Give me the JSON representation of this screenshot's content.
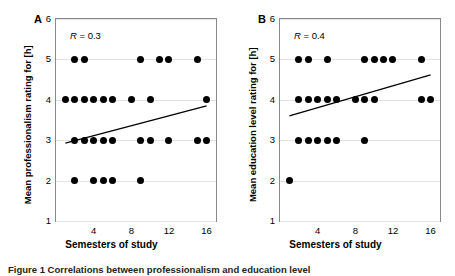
{
  "figure": {
    "caption": "Figure 1 Correlations between professionalism and education level"
  },
  "panels": [
    {
      "letter": "A",
      "ylabel": "Mean professionalism rating for [h]",
      "xlabel": "Semesters of study",
      "r_symbol": "R",
      "r_text": " = 0.3",
      "yticks": [
        "6",
        "5",
        "4",
        "3",
        "2",
        "1"
      ],
      "xticks": [
        "4",
        "8",
        "12",
        "16"
      ]
    },
    {
      "letter": "B",
      "ylabel": "Mean education level rating for [h]",
      "xlabel": "Semesters of study",
      "r_symbol": "R",
      "r_text": " = 0.4",
      "yticks": [
        "6",
        "5",
        "4",
        "3",
        "2",
        "1"
      ],
      "xticks": [
        "4",
        "8",
        "12",
        "16"
      ]
    }
  ],
  "chart_data": [
    {
      "type": "scatter",
      "panel": "A",
      "title": "",
      "xlabel": "Semesters of study",
      "ylabel": "Mean professionalism rating for [h]",
      "xlim": [
        0,
        17
      ],
      "ylim": [
        1,
        6
      ],
      "xticks": [
        4,
        8,
        12,
        16
      ],
      "yticks": [
        1,
        2,
        3,
        4,
        5,
        6
      ],
      "grid": true,
      "legend": null,
      "annotations": [
        {
          "text": "R = 0.3",
          "x": 2,
          "y": 5.6
        }
      ],
      "correlation_R": 0.3,
      "points": [
        {
          "x": 1,
          "y": 4
        },
        {
          "x": 2,
          "y": 5
        },
        {
          "x": 3,
          "y": 5
        },
        {
          "x": 9,
          "y": 5
        },
        {
          "x": 11,
          "y": 5
        },
        {
          "x": 12,
          "y": 5
        },
        {
          "x": 15,
          "y": 5
        },
        {
          "x": 2,
          "y": 4
        },
        {
          "x": 3,
          "y": 4
        },
        {
          "x": 4,
          "y": 4
        },
        {
          "x": 5,
          "y": 4
        },
        {
          "x": 6,
          "y": 4
        },
        {
          "x": 8,
          "y": 4
        },
        {
          "x": 10,
          "y": 4
        },
        {
          "x": 16,
          "y": 4
        },
        {
          "x": 2,
          "y": 3
        },
        {
          "x": 3,
          "y": 3
        },
        {
          "x": 4,
          "y": 3
        },
        {
          "x": 5,
          "y": 3
        },
        {
          "x": 6,
          "y": 3
        },
        {
          "x": 9,
          "y": 3
        },
        {
          "x": 10,
          "y": 3
        },
        {
          "x": 12,
          "y": 3
        },
        {
          "x": 15,
          "y": 3
        },
        {
          "x": 16,
          "y": 3
        },
        {
          "x": 2,
          "y": 2
        },
        {
          "x": 4,
          "y": 2
        },
        {
          "x": 5,
          "y": 2
        },
        {
          "x": 6,
          "y": 2
        },
        {
          "x": 9,
          "y": 2
        }
      ],
      "fit_line": {
        "x1": 1,
        "y1": 2.93,
        "x2": 16,
        "y2": 3.85
      }
    },
    {
      "type": "scatter",
      "panel": "B",
      "title": "",
      "xlabel": "Semesters of study",
      "ylabel": "Mean education level rating for [h]",
      "xlim": [
        0,
        17
      ],
      "ylim": [
        1,
        6
      ],
      "xticks": [
        4,
        8,
        12,
        16
      ],
      "yticks": [
        1,
        2,
        3,
        4,
        5,
        6
      ],
      "grid": true,
      "legend": null,
      "annotations": [
        {
          "text": "R = 0.4",
          "x": 2,
          "y": 5.6
        }
      ],
      "correlation_R": 0.4,
      "points": [
        {
          "x": 2,
          "y": 5
        },
        {
          "x": 3,
          "y": 5
        },
        {
          "x": 5,
          "y": 5
        },
        {
          "x": 9,
          "y": 5
        },
        {
          "x": 10,
          "y": 5
        },
        {
          "x": 11,
          "y": 5
        },
        {
          "x": 12,
          "y": 5
        },
        {
          "x": 15,
          "y": 5
        },
        {
          "x": 2,
          "y": 4
        },
        {
          "x": 3,
          "y": 4
        },
        {
          "x": 4,
          "y": 4
        },
        {
          "x": 5,
          "y": 4
        },
        {
          "x": 6,
          "y": 4
        },
        {
          "x": 8,
          "y": 4
        },
        {
          "x": 9,
          "y": 4
        },
        {
          "x": 10,
          "y": 4
        },
        {
          "x": 15,
          "y": 4
        },
        {
          "x": 16,
          "y": 4
        },
        {
          "x": 2,
          "y": 3
        },
        {
          "x": 3,
          "y": 3
        },
        {
          "x": 4,
          "y": 3
        },
        {
          "x": 5,
          "y": 3
        },
        {
          "x": 6,
          "y": 3
        },
        {
          "x": 9,
          "y": 3
        },
        {
          "x": 1,
          "y": 2
        }
      ],
      "fit_line": {
        "x1": 1,
        "y1": 3.6,
        "x2": 16,
        "y2": 4.62
      }
    }
  ]
}
